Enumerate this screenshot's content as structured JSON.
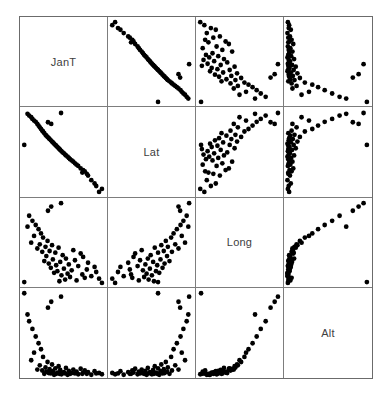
{
  "chart_data": {
    "type": "scatter",
    "title": "",
    "subtitle": "",
    "layout": "scatterplot-matrix",
    "matrix_size": 4,
    "grid": false,
    "legend": "none",
    "variables": [
      {
        "name": "JanT",
        "label": "JanT",
        "axis_label": "JanT"
      },
      {
        "name": "Lat",
        "label": "Lat",
        "axis_label": "Lat"
      },
      {
        "name": "Long",
        "label": "Long",
        "axis_label": "Long"
      },
      {
        "name": "Alt",
        "label": "Alt",
        "axis_label": "Alt"
      }
    ],
    "diagonal_labels": [
      "JanT",
      "Lat",
      "Long",
      "Alt"
    ],
    "n_points": 56,
    "axis_ranges": {
      "JanT": [
        0,
        100
      ],
      "Lat": [
        0,
        100
      ],
      "Long": [
        0,
        100
      ],
      "Alt": [
        0,
        100
      ]
    },
    "points": [
      {
        "JanT": 93.5,
        "Lat": 2.0,
        "Long": 7.0,
        "Alt": 3.0
      },
      {
        "JanT": 97.0,
        "Lat": 5.5,
        "Long": 2.0,
        "Alt": 1.5
      },
      {
        "JanT": 90.0,
        "Lat": 9.0,
        "Long": 15.0,
        "Alt": 2.5
      },
      {
        "JanT": 88.0,
        "Lat": 12.0,
        "Long": 21.0,
        "Alt": 5.0
      },
      {
        "JanT": 84.0,
        "Lat": 16.0,
        "Long": 10.0,
        "Alt": 1.0
      },
      {
        "JanT": 80.0,
        "Lat": 21.5,
        "Long": 26.0,
        "Alt": 4.0
      },
      {
        "JanT": 78.5,
        "Lat": 23.5,
        "Long": 18.0,
        "Alt": 2.0
      },
      {
        "JanT": 76.0,
        "Lat": 26.5,
        "Long": 8.0,
        "Alt": 6.0
      },
      {
        "JanT": 74.0,
        "Lat": 28.0,
        "Long": 33.0,
        "Alt": 3.5
      },
      {
        "JanT": 73.0,
        "Lat": 25.0,
        "Long": 12.0,
        "Alt": 2.0
      },
      {
        "JanT": 71.0,
        "Lat": 30.0,
        "Long": 37.0,
        "Alt": 8.0
      },
      {
        "JanT": 68.0,
        "Lat": 33.0,
        "Long": 22.0,
        "Alt": 1.5
      },
      {
        "JanT": 66.0,
        "Lat": 34.5,
        "Long": 5.0,
        "Alt": 4.5
      },
      {
        "JanT": 64.0,
        "Lat": 36.0,
        "Long": 29.0,
        "Alt": 2.5
      },
      {
        "JanT": 62.0,
        "Lat": 38.0,
        "Long": 41.0,
        "Alt": 7.0
      },
      {
        "JanT": 60.0,
        "Lat": 39.5,
        "Long": 17.0,
        "Alt": 3.0
      },
      {
        "JanT": 58.0,
        "Lat": 41.0,
        "Long": 9.0,
        "Alt": 2.0
      },
      {
        "JanT": 56.5,
        "Lat": 42.5,
        "Long": 24.0,
        "Alt": 5.5
      },
      {
        "JanT": 55.0,
        "Lat": 44.0,
        "Long": 13.0,
        "Alt": 1.0
      },
      {
        "JanT": 53.0,
        "Lat": 45.5,
        "Long": 31.0,
        "Alt": 9.0
      },
      {
        "JanT": 52.0,
        "Lat": 46.5,
        "Long": 6.0,
        "Alt": 2.5
      },
      {
        "JanT": 50.5,
        "Lat": 48.0,
        "Long": 19.0,
        "Alt": 4.0
      },
      {
        "JanT": 49.0,
        "Lat": 49.0,
        "Long": 35.0,
        "Alt": 3.0
      },
      {
        "JanT": 47.5,
        "Lat": 50.5,
        "Long": 11.0,
        "Alt": 1.5
      },
      {
        "JanT": 46.0,
        "Lat": 52.0,
        "Long": 27.0,
        "Alt": 6.5
      },
      {
        "JanT": 45.0,
        "Lat": 53.0,
        "Long": 4.0,
        "Alt": 2.0
      },
      {
        "JanT": 44.0,
        "Lat": 54.0,
        "Long": 44.0,
        "Alt": 11.0
      },
      {
        "JanT": 42.5,
        "Lat": 55.5,
        "Long": 16.0,
        "Alt": 3.5
      },
      {
        "JanT": 41.0,
        "Lat": 57.0,
        "Long": 23.0,
        "Alt": 2.0
      },
      {
        "JanT": 40.0,
        "Lat": 58.0,
        "Long": 38.0,
        "Alt": 8.5
      },
      {
        "JanT": 38.5,
        "Lat": 59.5,
        "Long": 14.0,
        "Alt": 1.0
      },
      {
        "JanT": 37.0,
        "Lat": 61.0,
        "Long": 30.0,
        "Alt": 5.0
      },
      {
        "JanT": 36.0,
        "Lat": 62.0,
        "Long": 47.0,
        "Alt": 13.0
      },
      {
        "JanT": 34.5,
        "Lat": 63.5,
        "Long": 20.0,
        "Alt": 2.5
      },
      {
        "JanT": 33.0,
        "Lat": 65.0,
        "Long": 40.0,
        "Alt": 7.5
      },
      {
        "JanT": 32.0,
        "Lat": 66.0,
        "Long": 25.0,
        "Alt": 3.0
      },
      {
        "JanT": 30.5,
        "Lat": 67.5,
        "Long": 52.0,
        "Alt": 16.0
      },
      {
        "JanT": 29.0,
        "Lat": 69.0,
        "Long": 34.0,
        "Alt": 4.5
      },
      {
        "JanT": 28.0,
        "Lat": 70.0,
        "Long": 45.0,
        "Alt": 9.5
      },
      {
        "JanT": 26.5,
        "Lat": 72.0,
        "Long": 28.0,
        "Alt": 2.0
      },
      {
        "JanT": 25.0,
        "Lat": 74.0,
        "Long": 56.0,
        "Alt": 22.0
      },
      {
        "JanT": 24.0,
        "Lat": 75.0,
        "Long": 39.0,
        "Alt": 6.0
      },
      {
        "JanT": 22.5,
        "Lat": 77.0,
        "Long": 61.0,
        "Alt": 31.0
      },
      {
        "JanT": 21.0,
        "Lat": 79.0,
        "Long": 48.0,
        "Alt": 12.0
      },
      {
        "JanT": 19.5,
        "Lat": 81.0,
        "Long": 66.0,
        "Alt": 38.0
      },
      {
        "JanT": 18.0,
        "Lat": 83.0,
        "Long": 43.0,
        "Alt": 7.0
      },
      {
        "JanT": 16.0,
        "Lat": 85.5,
        "Long": 71.0,
        "Alt": 46.0
      },
      {
        "JanT": 14.0,
        "Lat": 87.0,
        "Long": 58.0,
        "Alt": 27.0
      },
      {
        "JanT": 12.0,
        "Lat": 89.0,
        "Long": 76.0,
        "Alt": 55.0
      },
      {
        "JanT": 10.5,
        "Lat": 91.0,
        "Long": 50.0,
        "Alt": 18.0
      },
      {
        "JanT": 8.0,
        "Lat": 93.0,
        "Long": 82.0,
        "Alt": 64.0
      },
      {
        "JanT": 6.0,
        "Lat": 95.0,
        "Long": 69.0,
        "Alt": 72.0
      },
      {
        "JanT": 31.0,
        "Lat": 85.0,
        "Long": 88.0,
        "Alt": 80.0
      },
      {
        "JanT": 35.0,
        "Lat": 83.0,
        "Long": 93.0,
        "Alt": 87.0
      },
      {
        "JanT": 47.0,
        "Lat": 96.0,
        "Long": 97.0,
        "Alt": 93.0
      },
      {
        "JanT": 2.0,
        "Lat": 58.0,
        "Long": 3.0,
        "Alt": 97.0
      }
    ],
    "point_style": {
      "marker": "filled-circle",
      "color": "#000000",
      "radius_px": 2.4
    },
    "frame_color": "#6b6b6b",
    "background_color": "#ffffff"
  }
}
